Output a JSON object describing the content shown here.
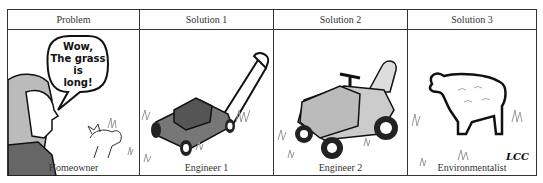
{
  "panels": [
    {
      "header": "Problem",
      "caption": "Homeowner",
      "speech": [
        "Wow,",
        "The grass",
        "is",
        "long!"
      ]
    },
    {
      "header": "Solution 1",
      "caption": "Engineer 1"
    },
    {
      "header": "Solution 2",
      "caption": "Engineer 2"
    },
    {
      "header": "Solution 3",
      "caption": "Environmentalist",
      "signature": "LCC"
    }
  ]
}
